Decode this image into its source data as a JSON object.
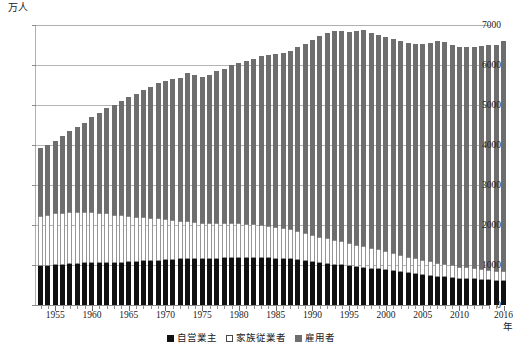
{
  "axis": {
    "unit_label": "万人",
    "x_unit_label": "年",
    "y_ticks": [
      0,
      1000,
      2000,
      3000,
      4000,
      5000,
      6000,
      7000
    ],
    "x_ticks": [
      1955,
      1960,
      1965,
      1970,
      1975,
      1980,
      1985,
      1990,
      1995,
      2000,
      2005,
      2010,
      2016
    ]
  },
  "legend": {
    "items": [
      {
        "label": "自営業主",
        "swatch": "sw-self",
        "name": "legend-self-employed"
      },
      {
        "label": "家族従業者",
        "swatch": "sw-fam",
        "name": "legend-family-worker"
      },
      {
        "label": "雇用者",
        "swatch": "sw-emp",
        "name": "legend-employee"
      }
    ]
  },
  "colors": {
    "self_employed": "#111111",
    "family_worker": "#ffffff",
    "employee": "#6e6e6e",
    "gridline": "#b5b5b5",
    "axis": "#8c8c8c"
  },
  "chart_data": {
    "type": "bar",
    "title": "",
    "subtitle": "",
    "xlabel": "年",
    "ylabel": "万人",
    "ylim": [
      0,
      7000
    ],
    "xlim": [
      1953,
      2016
    ],
    "grid": true,
    "stacked": true,
    "legend_position": "bottom",
    "categories": [
      1953,
      1954,
      1955,
      1956,
      1957,
      1958,
      1959,
      1960,
      1961,
      1962,
      1963,
      1964,
      1965,
      1966,
      1967,
      1968,
      1969,
      1970,
      1971,
      1972,
      1973,
      1974,
      1975,
      1976,
      1977,
      1978,
      1979,
      1980,
      1981,
      1982,
      1983,
      1984,
      1985,
      1986,
      1987,
      1988,
      1989,
      1990,
      1991,
      1992,
      1993,
      1994,
      1995,
      1996,
      1997,
      1998,
      1999,
      2000,
      2001,
      2002,
      2003,
      2004,
      2005,
      2006,
      2007,
      2008,
      2009,
      2010,
      2011,
      2012,
      2013,
      2014,
      2015,
      2016
    ],
    "series": [
      {
        "name": "自営業主",
        "color": "#111111",
        "values": [
          970,
          970,
          1000,
          1000,
          1030,
          1030,
          1040,
          1050,
          1050,
          1060,
          1060,
          1060,
          1070,
          1080,
          1090,
          1100,
          1110,
          1120,
          1130,
          1140,
          1150,
          1140,
          1140,
          1150,
          1160,
          1170,
          1180,
          1180,
          1180,
          1180,
          1180,
          1170,
          1160,
          1150,
          1140,
          1120,
          1100,
          1080,
          1050,
          1030,
          1010,
          990,
          970,
          950,
          930,
          910,
          890,
          870,
          850,
          820,
          790,
          770,
          750,
          730,
          710,
          700,
          680,
          660,
          650,
          640,
          630,
          620,
          610,
          600
        ]
      },
      {
        "name": "家族従業者",
        "color": "#ffffff",
        "values": [
          1250,
          1280,
          1290,
          1290,
          1300,
          1300,
          1290,
          1280,
          1250,
          1230,
          1200,
          1180,
          1150,
          1120,
          1100,
          1080,
          1060,
          1030,
          1000,
          970,
          950,
          930,
          910,
          900,
          890,
          880,
          870,
          860,
          850,
          840,
          830,
          810,
          790,
          770,
          750,
          730,
          710,
          680,
          660,
          640,
          620,
          600,
          580,
          560,
          540,
          520,
          500,
          480,
          460,
          440,
          420,
          400,
          380,
          360,
          340,
          330,
          310,
          300,
          290,
          280,
          270,
          260,
          250,
          240
        ]
      },
      {
        "name": "雇用者",
        "color": "#6e6e6e",
        "values": [
          1700,
          1760,
          1810,
          1930,
          2030,
          2110,
          2220,
          2370,
          2510,
          2640,
          2750,
          2870,
          2980,
          3070,
          3180,
          3280,
          3370,
          3450,
          3510,
          3570,
          3690,
          3680,
          3650,
          3710,
          3790,
          3860,
          3940,
          4010,
          4070,
          4140,
          4210,
          4270,
          4330,
          4390,
          4470,
          4590,
          4720,
          4860,
          5010,
          5140,
          5220,
          5250,
          5280,
          5330,
          5400,
          5370,
          5350,
          5360,
          5340,
          5340,
          5330,
          5350,
          5390,
          5470,
          5540,
          5550,
          5500,
          5500,
          5510,
          5520,
          5580,
          5610,
          5640,
          5750
        ]
      }
    ]
  }
}
